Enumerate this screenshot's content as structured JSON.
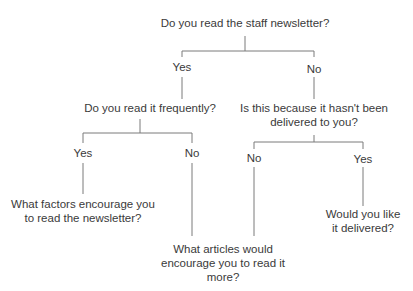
{
  "diagram": {
    "type": "decision-tree",
    "root": {
      "question": "Do you read the staff newsletter?",
      "yes_label": "Yes",
      "no_label": "No"
    },
    "yes_branch": {
      "question": "Do you read it frequently?",
      "yes_label": "Yes",
      "no_label": "No",
      "yes_outcome_line1": "What factors encourage you",
      "yes_outcome_line2": "to read the newsletter?"
    },
    "no_branch": {
      "question_line1": "Is this because it hasn't been",
      "question_line2": "delivered to you?",
      "no_label": "No",
      "yes_label": "Yes",
      "yes_outcome_line1": "Would you like",
      "yes_outcome_line2": "it delivered?"
    },
    "shared_outcome": {
      "line1": "What articles would",
      "line2": "encourage you to read it",
      "line3": "more?"
    }
  }
}
